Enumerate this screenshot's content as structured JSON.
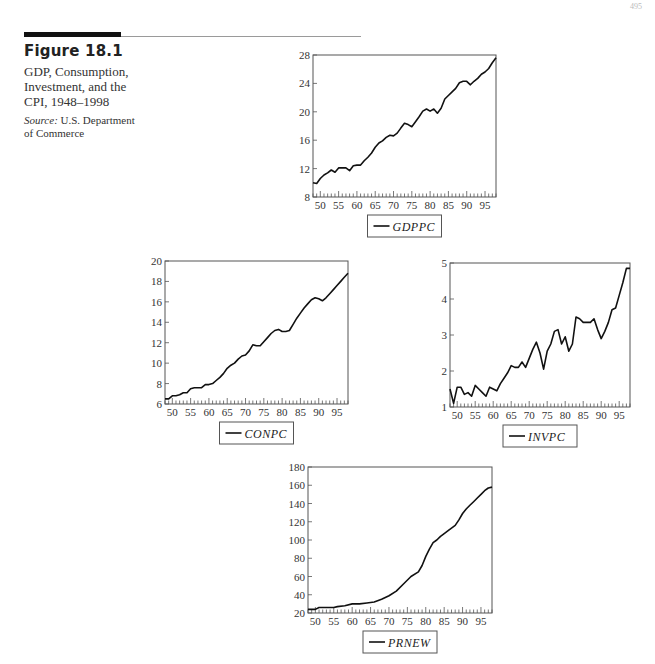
{
  "page": {
    "page_number": "495"
  },
  "figure": {
    "label": "Figure 18.1",
    "title": "GDP, Consumption, Investment, and the CPI, 1948–1998",
    "source_label": "Source:",
    "source_text": "U.S. Department of Commerce"
  },
  "chart_data": [
    {
      "id": "gdppc",
      "type": "line",
      "title": "",
      "legend": [
        "GDPPC"
      ],
      "xlabel": "",
      "ylabel": "",
      "x_tick_labels": [
        "50",
        "55",
        "60",
        "65",
        "70",
        "75",
        "80",
        "85",
        "90",
        "95"
      ],
      "y_tick_labels": [
        "8",
        "12",
        "16",
        "20",
        "24",
        "28"
      ],
      "xlim": [
        1948,
        1998
      ],
      "ylim": [
        8,
        28
      ],
      "grid": false,
      "legend_position": "below",
      "frame": {
        "left": 313,
        "top": 55,
        "right": 496,
        "bottom": 197
      },
      "series": [
        {
          "name": "GDPPC",
          "x": [
            1948,
            1949,
            1950,
            1951,
            1952,
            1953,
            1954,
            1955,
            1956,
            1957,
            1958,
            1959,
            1960,
            1961,
            1962,
            1963,
            1964,
            1965,
            1966,
            1967,
            1968,
            1969,
            1970,
            1971,
            1972,
            1973,
            1974,
            1975,
            1976,
            1977,
            1978,
            1979,
            1980,
            1981,
            1982,
            1983,
            1984,
            1985,
            1986,
            1987,
            1988,
            1989,
            1990,
            1991,
            1992,
            1993,
            1994,
            1995,
            1996,
            1997,
            1998
          ],
          "values": [
            10.0,
            9.9,
            10.6,
            11.1,
            11.4,
            11.8,
            11.5,
            12.1,
            12.1,
            12.1,
            11.7,
            12.4,
            12.5,
            12.5,
            13.1,
            13.6,
            14.2,
            15.0,
            15.6,
            15.9,
            16.4,
            16.7,
            16.6,
            17.0,
            17.7,
            18.4,
            18.2,
            17.9,
            18.6,
            19.3,
            20.1,
            20.4,
            20.1,
            20.4,
            19.8,
            20.5,
            21.8,
            22.3,
            22.8,
            23.3,
            24.1,
            24.3,
            24.3,
            23.8,
            24.3,
            24.7,
            25.3,
            25.6,
            26.1,
            26.9,
            27.6
          ]
        }
      ]
    },
    {
      "id": "conpc",
      "type": "line",
      "title": "",
      "legend": [
        "CONPC"
      ],
      "xlabel": "",
      "ylabel": "",
      "x_tick_labels": [
        "50",
        "55",
        "60",
        "65",
        "70",
        "75",
        "80",
        "85",
        "90",
        "95"
      ],
      "y_tick_labels": [
        "6",
        "8",
        "10",
        "12",
        "14",
        "16",
        "18",
        "20"
      ],
      "xlim": [
        1948,
        1998
      ],
      "ylim": [
        6,
        20
      ],
      "grid": false,
      "legend_position": "below",
      "frame": {
        "left": 165,
        "top": 261,
        "right": 348,
        "bottom": 404
      },
      "series": [
        {
          "name": "CONPC",
          "x": [
            1948,
            1949,
            1950,
            1951,
            1952,
            1953,
            1954,
            1955,
            1956,
            1957,
            1958,
            1959,
            1960,
            1961,
            1962,
            1963,
            1964,
            1965,
            1966,
            1967,
            1968,
            1969,
            1970,
            1971,
            1972,
            1973,
            1974,
            1975,
            1976,
            1977,
            1978,
            1979,
            1980,
            1981,
            1982,
            1983,
            1984,
            1985,
            1986,
            1987,
            1988,
            1989,
            1990,
            1991,
            1992,
            1993,
            1994,
            1995,
            1996,
            1997,
            1998
          ],
          "values": [
            6.5,
            6.5,
            6.8,
            6.8,
            6.9,
            7.1,
            7.1,
            7.5,
            7.6,
            7.6,
            7.6,
            7.9,
            7.9,
            8.0,
            8.3,
            8.6,
            9.0,
            9.5,
            9.8,
            10.0,
            10.4,
            10.7,
            10.8,
            11.2,
            11.8,
            11.7,
            11.7,
            12.1,
            12.5,
            12.9,
            13.2,
            13.3,
            13.1,
            13.1,
            13.2,
            13.8,
            14.4,
            14.9,
            15.4,
            15.8,
            16.2,
            16.4,
            16.3,
            16.1,
            16.4,
            16.8,
            17.2,
            17.6,
            18.0,
            18.4,
            18.8
          ]
        }
      ]
    },
    {
      "id": "invpc",
      "type": "line",
      "title": "",
      "legend": [
        "INVPC"
      ],
      "xlabel": "",
      "ylabel": "",
      "x_tick_labels": [
        "50",
        "55",
        "60",
        "65",
        "70",
        "75",
        "80",
        "85",
        "90",
        "95"
      ],
      "y_tick_labels": [
        "1",
        "2",
        "3",
        "4",
        "5"
      ],
      "xlim": [
        1948,
        1998
      ],
      "ylim": [
        1,
        5
      ],
      "grid": false,
      "legend_position": "below",
      "frame": {
        "left": 450,
        "top": 263,
        "right": 630,
        "bottom": 407
      },
      "series": [
        {
          "name": "INVPC",
          "x": [
            1948,
            1949,
            1950,
            1951,
            1952,
            1953,
            1954,
            1955,
            1956,
            1957,
            1958,
            1959,
            1960,
            1961,
            1962,
            1963,
            1964,
            1965,
            1966,
            1967,
            1968,
            1969,
            1970,
            1971,
            1972,
            1973,
            1974,
            1975,
            1976,
            1977,
            1978,
            1979,
            1980,
            1981,
            1982,
            1983,
            1984,
            1985,
            1986,
            1987,
            1988,
            1989,
            1990,
            1991,
            1992,
            1993,
            1994,
            1995,
            1996,
            1997,
            1998
          ],
          "values": [
            1.5,
            1.1,
            1.55,
            1.55,
            1.35,
            1.4,
            1.3,
            1.6,
            1.5,
            1.4,
            1.3,
            1.55,
            1.5,
            1.45,
            1.65,
            1.8,
            1.95,
            2.15,
            2.1,
            2.1,
            2.25,
            2.1,
            2.35,
            2.6,
            2.8,
            2.5,
            2.05,
            2.55,
            2.75,
            3.1,
            3.15,
            2.75,
            2.95,
            2.55,
            2.75,
            3.5,
            3.45,
            3.35,
            3.35,
            3.35,
            3.45,
            3.15,
            2.9,
            3.1,
            3.35,
            3.7,
            3.75,
            4.1,
            4.45,
            4.85,
            4.85
          ]
        }
      ]
    },
    {
      "id": "prnew",
      "type": "line",
      "title": "",
      "legend": [
        "PRNEW"
      ],
      "xlabel": "",
      "ylabel": "",
      "x_tick_labels": [
        "50",
        "55",
        "60",
        "65",
        "70",
        "75",
        "80",
        "85",
        "90",
        "95"
      ],
      "y_tick_labels": [
        "20",
        "40",
        "60",
        "80",
        "100",
        "120",
        "140",
        "160",
        "180"
      ],
      "xlim": [
        1948,
        1998
      ],
      "ylim": [
        20,
        180
      ],
      "grid": false,
      "legend_position": "below",
      "frame": {
        "left": 308,
        "top": 467,
        "right": 492,
        "bottom": 613
      },
      "series": [
        {
          "name": "PRNEW",
          "x": [
            1948,
            1950,
            1951,
            1955,
            1956,
            1958,
            1960,
            1962,
            1964,
            1966,
            1968,
            1970,
            1972,
            1974,
            1976,
            1978,
            1979,
            1980,
            1981,
            1982,
            1983,
            1984,
            1985,
            1986,
            1987,
            1988,
            1989,
            1990,
            1991,
            1992,
            1993,
            1994,
            1995,
            1996,
            1997,
            1998
          ],
          "values": [
            24,
            24,
            26,
            26,
            27,
            28,
            30,
            30,
            31,
            32,
            35,
            39,
            44,
            52,
            60,
            65,
            72,
            82,
            90,
            97,
            100,
            104,
            107,
            110,
            113,
            116,
            122,
            129,
            134,
            138,
            142,
            146,
            150,
            154,
            157,
            158
          ]
        }
      ]
    }
  ]
}
